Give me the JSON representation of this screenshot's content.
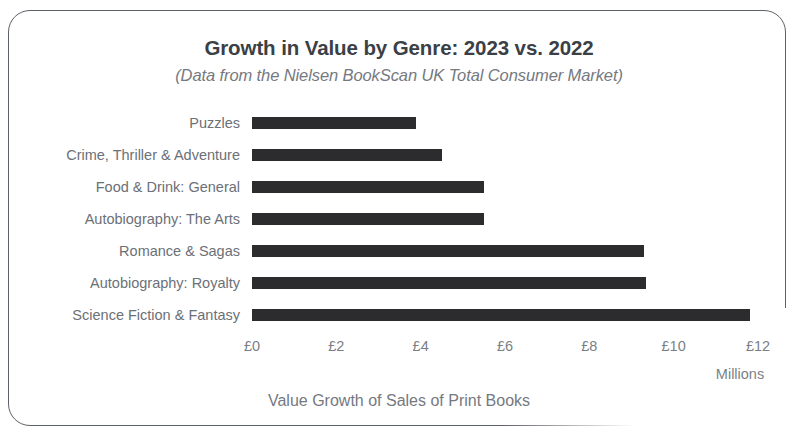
{
  "chart_data": {
    "type": "bar",
    "orientation": "horizontal",
    "title": "Growth in Value by Genre: 2023 vs. 2022",
    "subtitle": "(Data from the Nielsen BookScan UK Total Consumer Market)",
    "xlabel": "Value Growth of Sales of Print Books",
    "ylabel": "",
    "units_label": "Millions",
    "categories": [
      "Puzzles",
      "Crime, Thriller & Adventure",
      "Food & Drink: General",
      "Autobiography:  The Arts",
      "Romance & Sagas",
      "Autobiography: Royalty",
      "Science Fiction & Fantasy"
    ],
    "values": [
      3.9,
      4.5,
      5.5,
      5.5,
      9.3,
      9.35,
      11.8
    ],
    "xticks": [
      0,
      2,
      4,
      6,
      8,
      10,
      12
    ],
    "xtick_labels": [
      "£0",
      "£2",
      "£4",
      "£6",
      "£8",
      "£10",
      "£12"
    ],
    "xlim": [
      0,
      12
    ],
    "grid": false,
    "legend": false,
    "bar_color": "#2c2c2e",
    "title_color": "#3b3f46",
    "label_color": "#6c7077"
  }
}
